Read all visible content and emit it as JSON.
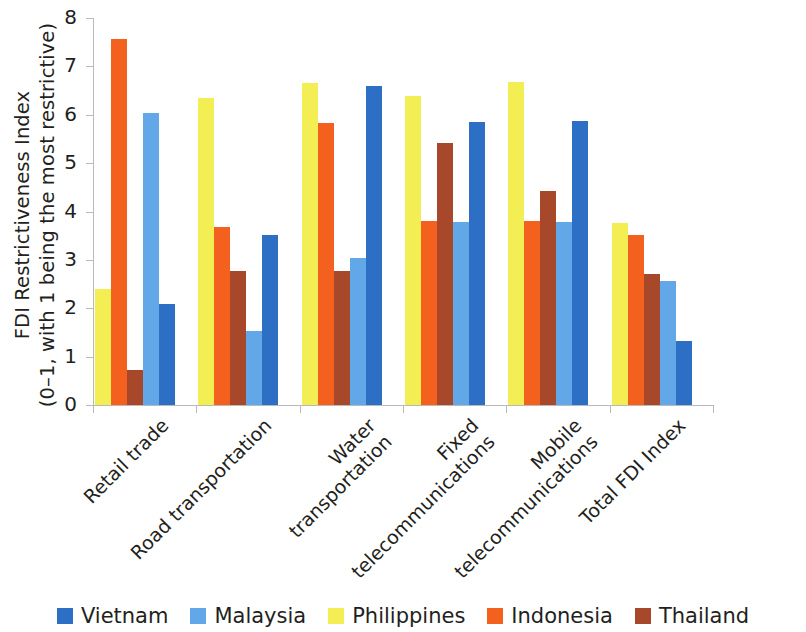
{
  "chart_data": {
    "type": "bar",
    "title": "",
    "xlabel": "",
    "ylabel": "FDI Restrictiveness Index\n(0–1, with 1 being the most restrictive)",
    "ylim": [
      0,
      8
    ],
    "yticks": [
      "0",
      "1",
      "2",
      "3",
      "4",
      "5",
      "6",
      "7",
      "8"
    ],
    "grid": false,
    "legend_position": "bottom",
    "categories": [
      "Retail trade",
      "Road transportation",
      "Water\ntransportation",
      "Fixed\ntelecommunications",
      "Mobile\ntelecommunications",
      "Total FDI Index"
    ],
    "series": [
      {
        "name": "Philippines",
        "color": "#f2ee53",
        "values": [
          2.39,
          6.35,
          6.66,
          6.38,
          6.67,
          3.76
        ]
      },
      {
        "name": "Indonesia",
        "color": "#f4601e",
        "values": [
          7.56,
          3.68,
          5.82,
          3.8,
          3.81,
          3.51
        ]
      },
      {
        "name": "Thailand",
        "color": "#a8482b",
        "values": [
          0.73,
          2.78,
          2.78,
          5.42,
          4.43,
          2.71
        ]
      },
      {
        "name": "Malaysia",
        "color": "#62a8e8",
        "values": [
          6.04,
          1.52,
          3.04,
          3.78,
          3.78,
          2.56
        ]
      },
      {
        "name": "Vietnam",
        "color": "#2d6fc4",
        "values": [
          2.08,
          3.52,
          6.6,
          5.86,
          5.88,
          1.33
        ]
      }
    ],
    "legend_order": [
      "Vietnam",
      "Malaysia",
      "Philippines",
      "Indonesia",
      "Thailand"
    ],
    "bar_draw_order": [
      "Philippines",
      "Indonesia",
      "Thailand",
      "Malaysia",
      "Vietnam"
    ]
  },
  "colors": {
    "vietnam": "#2d6fc4",
    "malaysia": "#62a8e8",
    "philippines": "#f2ee53",
    "indonesia": "#f4601e",
    "thailand": "#a8482b",
    "axis": "#b9b9b9",
    "text": "#231f20",
    "background": "#ffffff"
  }
}
